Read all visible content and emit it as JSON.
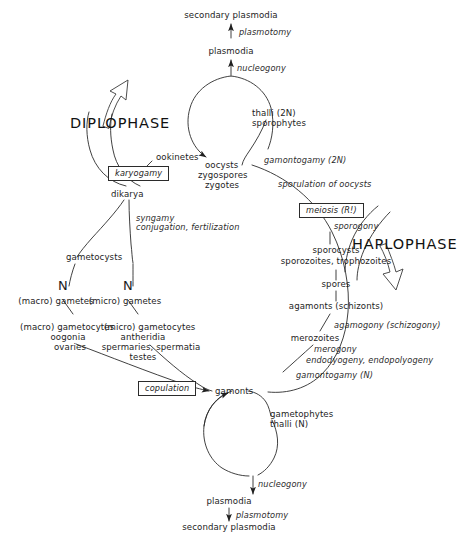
{
  "diagram": {
    "phases": {
      "diplophase": "DIPLOPHASE",
      "haplophase": "HAPLOPHASE"
    },
    "boxes": {
      "karyogamy": "karyogamy",
      "meiosis": "meiosis (R!)",
      "copulation": "copulation"
    },
    "top": {
      "secondary_plasmodia": "secondary plasmodia",
      "plasmotomy": "plasmotomy",
      "plasmodia": "plasmodia",
      "nucleogony": "nucleogony"
    },
    "bottom": {
      "nucleogony": "nucleogony",
      "plasmodia": "plasmodia",
      "plasmotomy": "plasmotomy",
      "secondary_plasmodia": "secondary plasmodia"
    },
    "diploid": {
      "thalli": "thalli (2N)",
      "sporophytes": "sporophytes",
      "oocysts": "oocysts",
      "zygospores": "zygospores",
      "zygotes": "zygotes",
      "ookinetes": "ookinetes",
      "dikarya": "dikarya",
      "gamontogamy_2n": "gamontogamy (2N)",
      "sporulation_of_oocysts": "sporulation of oocysts",
      "sporogony": "sporogony"
    },
    "haploid": {
      "sporocysts": "sporocysts",
      "sporozoites_trophozoites": "sporozoites, trophozoites",
      "spores": "spores",
      "agamonts": "agamonts (schizonts)",
      "agamogony": "agamogony (schizogony)",
      "merozoites": "merozoites",
      "merogony": "merogony",
      "endodyogeny": "endodyogeny, endopolyogeny",
      "gamontogamy_n": "gamontogamy (N)",
      "gamonts": "gamonts",
      "gametophytes": "gametophytes",
      "thalli_n": "thalli (N)"
    },
    "gametes": {
      "gametocysts": "gametocysts",
      "syngamy": "syngamy",
      "conjugation_fertilization": "conjugation, fertilization",
      "n_left": "N",
      "n_right": "N",
      "macro_gametes": "(macro) gametes",
      "micro_gametes": "(micro) gametes",
      "macro_gametocytes": "(macro) gametocytes",
      "oogonia": "oogonia",
      "ovaries": "ovaries",
      "micro_gametocytes": "(micro) gametocytes",
      "antheridia": "antheridia",
      "spermaries_spermatia": "spermaries, spermatia",
      "testes": "testes"
    },
    "colors": {
      "ink": "#1d1d1d",
      "line": "#2b2b2b",
      "background": "#ffffff"
    }
  }
}
